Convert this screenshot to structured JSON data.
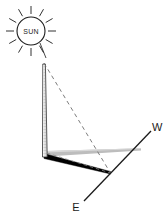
{
  "diagram": {
    "type": "astronomy-shadow-diagram",
    "background_color": "#ffffff",
    "labels": {
      "sun": "SUN",
      "west": "W",
      "east": "E"
    },
    "colors": {
      "outline": "#1b1b1b",
      "shadow": "#000000",
      "ground_band": "#b9b9b9",
      "pole_fill": "#f2f2f2",
      "dashed_ray": "#6e6e6e",
      "axis_line": "#1b1b1b"
    },
    "sun": {
      "label": "SUN",
      "center_x": 31,
      "center_y": 31,
      "radius": 14,
      "ray_count": 12,
      "ray_inner": 17,
      "ray_outer": 25
    },
    "gnomon": {
      "name": "vertical pole",
      "top_x": 44,
      "top_y": 64,
      "base_x": 45,
      "base_y": 156,
      "width_top": 3,
      "width_base": 5
    },
    "shadow": {
      "name": "cast shadow",
      "from_x": 45,
      "from_y": 157,
      "to_x": 110,
      "to_y": 173,
      "thickness": 5
    },
    "ground_band": {
      "name": "ground reference band",
      "from_x": 47,
      "from_y": 153,
      "to_x": 141,
      "to_y": 149,
      "thickness_near": 5,
      "thickness_far": 2
    },
    "sun_rays_dashed": [
      {
        "name": "ray-to-pole-top",
        "x1": 44,
        "y1": 64,
        "x2": 110,
        "y2": 173
      },
      {
        "name": "ray-to-base",
        "x1": 46,
        "y1": 155,
        "x2": 110,
        "y2": 173
      }
    ],
    "axis": {
      "name": "east-west axis",
      "west_x": 151,
      "west_y": 131,
      "east_x": 84,
      "east_y": 201,
      "west_label_x": 155,
      "west_label_y": 130,
      "east_label_x": 76,
      "east_label_y": 210
    }
  }
}
